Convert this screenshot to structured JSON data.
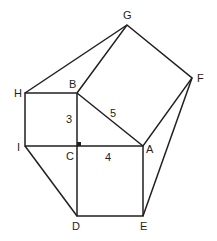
{
  "diagram": {
    "title": "",
    "stroke_color": "#231f20",
    "points": {
      "G": {
        "label": "G",
        "x": 127,
        "y": 25
      },
      "F": {
        "label": "F",
        "x": 192,
        "y": 78
      },
      "H": {
        "label": "H",
        "x": 25,
        "y": 93
      },
      "B": {
        "label": "B",
        "x": 77,
        "y": 93
      },
      "I": {
        "label": "I",
        "x": 25,
        "y": 146
      },
      "C": {
        "label": "C",
        "x": 77,
        "y": 146
      },
      "A": {
        "label": "A",
        "x": 143,
        "y": 146
      },
      "D": {
        "label": "D",
        "x": 77,
        "y": 216
      },
      "E": {
        "label": "E",
        "x": 143,
        "y": 216
      }
    },
    "side_labels": {
      "BC": "3",
      "CA": "4",
      "AB": "5"
    },
    "right_angle_at": "C"
  }
}
